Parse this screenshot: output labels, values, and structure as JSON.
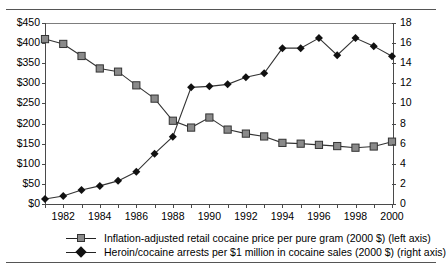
{
  "chart_data": {
    "type": "line",
    "title": "",
    "xlabel": "",
    "ylabel": "",
    "grid": false,
    "legend_position": "bottom",
    "x": [
      1981,
      1982,
      1983,
      1984,
      1985,
      1986,
      1987,
      1988,
      1989,
      1990,
      1991,
      1992,
      1993,
      1994,
      1995,
      1996,
      1997,
      1998,
      1999,
      2000
    ],
    "xtick_labels": [
      "1982",
      "1984",
      "1986",
      "1988",
      "1990",
      "1992",
      "1994",
      "1996",
      "1998",
      "2000"
    ],
    "xtick_values": [
      1982,
      1984,
      1986,
      1988,
      1990,
      1992,
      1994,
      1996,
      1998,
      2000
    ],
    "xlim": [
      1981,
      2000
    ],
    "left_axis": {
      "label": "Inflation-adjusted retail cocaine price per pure gram (2000 $)",
      "ylim": [
        0,
        450
      ],
      "ytick_labels": [
        "$0",
        "$50",
        "$100",
        "$150",
        "$200",
        "$250",
        "$300",
        "$350",
        "$400",
        "$450"
      ],
      "ytick_values": [
        0,
        50,
        100,
        150,
        200,
        250,
        300,
        350,
        400,
        450
      ]
    },
    "right_axis": {
      "label": "Heroin/cocaine arrests per $1 million in cocaine sales (2000 $)",
      "ylim": [
        0,
        18
      ],
      "ytick_labels": [
        "0",
        "2",
        "4",
        "6",
        "8",
        "10",
        "12",
        "14",
        "16",
        "18"
      ],
      "ytick_values": [
        0,
        2,
        4,
        6,
        8,
        10,
        12,
        14,
        16,
        18
      ]
    },
    "series": [
      {
        "name": "Inflation-adjusted retail cocaine price per pure gram (2000 $) (left axis)",
        "axis": "left",
        "marker": "square",
        "color": "#8a8a8a",
        "values": [
          410,
          398,
          368,
          337,
          329,
          295,
          262,
          207,
          190,
          215,
          185,
          175,
          168,
          152,
          150,
          147,
          144,
          140,
          143,
          155
        ]
      },
      {
        "name": "Heroin/cocaine arrests per $1 million in cocaine sales (2000 $) (right axis)",
        "axis": "right",
        "marker": "diamond",
        "color": "#111111",
        "values": [
          0.5,
          0.8,
          1.4,
          1.8,
          2.3,
          3.2,
          5.0,
          6.7,
          11.6,
          11.7,
          11.9,
          12.6,
          13.0,
          15.5,
          15.5,
          16.5,
          14.8,
          16.5,
          15.7,
          14.7
        ]
      }
    ]
  },
  "legend": {
    "items": [
      {
        "marker": "square",
        "label": "Inflation-adjusted retail cocaine price per pure gram (2000 $) (left axis)"
      },
      {
        "marker": "diamond",
        "label": "Heroin/cocaine arrests per $1 million in cocaine sales (2000 $) (right axis)"
      }
    ]
  }
}
